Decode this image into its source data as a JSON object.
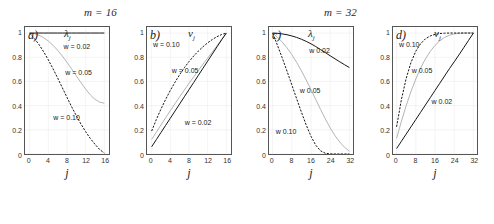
{
  "figure": {
    "group_titles": [
      {
        "name": "group-title-left",
        "text": "m = 16",
        "var": "m",
        "value": "16"
      },
      {
        "name": "group-title-right",
        "text": "m = 32",
        "var": "m",
        "value": "32"
      }
    ],
    "axis_x_label": "j",
    "y_ticks_common": [
      "1",
      "0.8",
      "0.6",
      "0.4",
      "0.2",
      "0"
    ],
    "x_ticks_m16": [
      "0",
      "4",
      "8",
      "12",
      "16"
    ],
    "x_ticks_m32": [
      "0",
      "8",
      "16",
      "24",
      "32"
    ],
    "colors": {
      "axis": "#555555",
      "curve_dark": "#111111",
      "curve_mid": "#777777",
      "curve_light": "#aaaaaa",
      "grid": "#e8e8e8",
      "text": "#222222"
    }
  },
  "panels": [
    {
      "letter": "a)",
      "ylabel_base": "λ",
      "ylabel_sub": "j",
      "xlabel": "j",
      "group": "m = 16",
      "curve_labels": [
        {
          "text": "w = 0.02",
          "x_pct": 46,
          "y_pct": 13
        },
        {
          "text": "w = 0.05",
          "x_pct": 48,
          "y_pct": 33
        },
        {
          "text": "w = 0.10",
          "x_pct": 34,
          "y_pct": 68
        }
      ]
    },
    {
      "letter": "b)",
      "ylabel_base": "v",
      "ylabel_sub": "j",
      "xlabel": "j",
      "group": "m = 16",
      "curve_labels": [
        {
          "text": "w = 0.10",
          "x_pct": 8,
          "y_pct": 12
        },
        {
          "text": "w = 0.05",
          "x_pct": 30,
          "y_pct": 32
        },
        {
          "text": "w = 0.02",
          "x_pct": 45,
          "y_pct": 72
        }
      ]
    },
    {
      "letter": "c)",
      "ylabel_base": "λ",
      "ylabel_sub": "j",
      "xlabel": "j",
      "group": "m = 32",
      "curve_labels": [
        {
          "text": "w   0.02",
          "x_pct": 48,
          "y_pct": 16
        },
        {
          "text": "w   0.05",
          "x_pct": 37,
          "y_pct": 47
        },
        {
          "text": "w   0.10",
          "x_pct": 9,
          "y_pct": 79
        }
      ]
    },
    {
      "letter": "d)",
      "ylabel_base": "v",
      "ylabel_sub": "j",
      "xlabel": "j",
      "group": "m = 32",
      "curve_labels": [
        {
          "text": "w   0.10",
          "x_pct": 8,
          "y_pct": 12
        },
        {
          "text": "w   0.05",
          "x_pct": 23,
          "y_pct": 32
        },
        {
          "text": "w   0.02",
          "x_pct": 46,
          "y_pct": 56
        }
      ]
    }
  ],
  "chart_data": [
    {
      "type": "line",
      "panel": "a",
      "title": "m = 16",
      "xlabel": "j",
      "ylabel": "lambda_j",
      "xlim": [
        -1,
        17
      ],
      "ylim": [
        0,
        1.05
      ],
      "xticks": [
        0,
        4,
        8,
        12,
        16
      ],
      "yticks": [
        0,
        0.2,
        0.4,
        0.6,
        0.8,
        1
      ],
      "grid": true,
      "legend": "inline-annotations",
      "x": [
        0,
        1,
        2,
        3,
        4,
        5,
        6,
        7,
        8,
        9,
        10,
        11,
        12,
        13,
        14,
        15,
        16
      ],
      "series": [
        {
          "name": "w = 0.02",
          "style": "solid-dark",
          "values": [
            1.0,
            1.0,
            1.0,
            1.0,
            1.0,
            1.0,
            1.0,
            1.0,
            1.0,
            1.0,
            1.0,
            1.0,
            1.0,
            1.0,
            1.0,
            1.0,
            1.0
          ]
        },
        {
          "name": "w = 0.05",
          "style": "solid-light",
          "values": [
            1.0,
            0.995,
            0.982,
            0.962,
            0.934,
            0.899,
            0.857,
            0.81,
            0.758,
            0.703,
            0.646,
            0.59,
            0.536,
            0.489,
            0.452,
            0.429,
            0.42
          ]
        },
        {
          "name": "w = 0.10",
          "style": "dashed-dark",
          "values": [
            1.0,
            0.955,
            0.905,
            0.845,
            0.778,
            0.705,
            0.628,
            0.548,
            0.468,
            0.39,
            0.316,
            0.247,
            0.184,
            0.128,
            0.08,
            0.037,
            0.008
          ]
        }
      ]
    },
    {
      "type": "line",
      "panel": "b",
      "title": "m = 16",
      "xlabel": "j",
      "ylabel": "v_j",
      "xlim": [
        -1,
        17
      ],
      "ylim": [
        0,
        1.05
      ],
      "xticks": [
        0,
        4,
        8,
        12,
        16
      ],
      "yticks": [
        0,
        0.2,
        0.4,
        0.6,
        0.8,
        1
      ],
      "grid": true,
      "legend": "inline-annotations",
      "x": [
        0,
        1,
        2,
        3,
        4,
        5,
        6,
        7,
        8,
        9,
        10,
        11,
        12,
        13,
        14,
        15,
        16
      ],
      "series": [
        {
          "name": "w = 0.02",
          "style": "solid-dark",
          "values": [
            0.06,
            0.119,
            0.178,
            0.237,
            0.296,
            0.355,
            0.414,
            0.473,
            0.532,
            0.591,
            0.65,
            0.709,
            0.768,
            0.827,
            0.886,
            0.944,
            1.0
          ]
        },
        {
          "name": "w = 0.05",
          "style": "solid-light",
          "values": [
            0.12,
            0.18,
            0.24,
            0.3,
            0.358,
            0.416,
            0.473,
            0.529,
            0.584,
            0.638,
            0.691,
            0.743,
            0.793,
            0.843,
            0.895,
            0.948,
            1.0
          ]
        },
        {
          "name": "w = 0.10",
          "style": "dashed-dark",
          "values": [
            0.19,
            0.285,
            0.372,
            0.452,
            0.526,
            0.594,
            0.656,
            0.713,
            0.764,
            0.81,
            0.851,
            0.887,
            0.919,
            0.947,
            0.97,
            0.988,
            1.0
          ]
        }
      ]
    },
    {
      "type": "line",
      "panel": "c",
      "title": "m = 32",
      "xlabel": "j",
      "ylabel": "lambda_j",
      "xlim": [
        -1.5,
        33.5
      ],
      "ylim": [
        0,
        1.05
      ],
      "xticks": [
        0,
        8,
        16,
        24,
        32
      ],
      "yticks": [
        0,
        0.2,
        0.4,
        0.6,
        0.8,
        1
      ],
      "grid": true,
      "legend": "inline-annotations",
      "x": [
        0,
        2,
        4,
        6,
        8,
        10,
        12,
        14,
        16,
        18,
        20,
        22,
        24,
        26,
        28,
        30,
        32
      ],
      "series": [
        {
          "name": "w = 0.02",
          "style": "solid-dark",
          "values": [
            1.0,
            0.998,
            0.993,
            0.986,
            0.976,
            0.964,
            0.949,
            0.931,
            0.911,
            0.888,
            0.863,
            0.838,
            0.812,
            0.787,
            0.762,
            0.738,
            0.715
          ]
        },
        {
          "name": "w = 0.05",
          "style": "solid-light",
          "values": [
            1.0,
            0.966,
            0.926,
            0.878,
            0.822,
            0.758,
            0.688,
            0.612,
            0.532,
            0.45,
            0.368,
            0.289,
            0.216,
            0.152,
            0.098,
            0.055,
            0.022
          ]
        },
        {
          "name": "w = 0.10",
          "style": "dashed-dark",
          "values": [
            1.0,
            0.9,
            0.795,
            0.685,
            0.572,
            0.458,
            0.346,
            0.24,
            0.146,
            0.072,
            0.026,
            0.006,
            0.001,
            0.0,
            0.0,
            0.0,
            0.0
          ]
        }
      ]
    },
    {
      "type": "line",
      "panel": "d",
      "title": "m = 32",
      "xlabel": "j",
      "ylabel": "v_j",
      "xlim": [
        -1.5,
        33.5
      ],
      "ylim": [
        0,
        1.05
      ],
      "xticks": [
        0,
        8,
        16,
        24,
        32
      ],
      "yticks": [
        0,
        0.2,
        0.4,
        0.6,
        0.8,
        1
      ],
      "grid": true,
      "legend": "inline-annotations",
      "x": [
        0,
        2,
        4,
        6,
        8,
        10,
        12,
        14,
        16,
        18,
        20,
        22,
        24,
        26,
        28,
        30,
        32
      ],
      "series": [
        {
          "name": "w = 0.02",
          "style": "solid-dark",
          "values": [
            0.045,
            0.105,
            0.165,
            0.225,
            0.285,
            0.345,
            0.405,
            0.465,
            0.525,
            0.585,
            0.645,
            0.705,
            0.762,
            0.82,
            0.88,
            0.94,
            1.0
          ]
        },
        {
          "name": "w = 0.05",
          "style": "solid-light",
          "values": [
            0.13,
            0.27,
            0.4,
            0.517,
            0.62,
            0.71,
            0.786,
            0.848,
            0.898,
            0.936,
            0.964,
            0.982,
            0.993,
            0.998,
            1.0,
            1.0,
            1.0
          ]
        },
        {
          "name": "w = 0.10",
          "style": "dashed-dark",
          "values": [
            0.225,
            0.45,
            0.625,
            0.757,
            0.85,
            0.912,
            0.952,
            0.976,
            0.989,
            0.996,
            0.999,
            1.0,
            1.0,
            1.0,
            1.0,
            1.0,
            1.0
          ]
        }
      ]
    }
  ]
}
